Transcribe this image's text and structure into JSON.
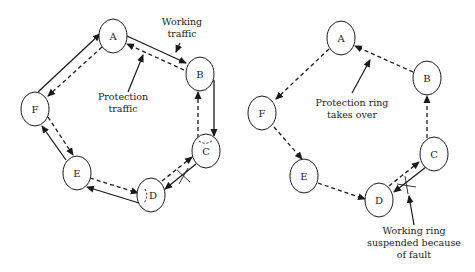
{
  "left_diagram": {
    "nodes": [
      {
        "id": "A",
        "label": "A",
        "cx": 113,
        "cy": 36
      },
      {
        "id": "B",
        "label": "B",
        "cx": 200,
        "cy": 74
      },
      {
        "id": "C",
        "label": "C",
        "cx": 206,
        "cy": 151
      },
      {
        "id": "D",
        "label": "D",
        "cx": 151,
        "cy": 195
      },
      {
        "id": "E",
        "label": "E",
        "cx": 77,
        "cy": 173
      },
      {
        "id": "F",
        "label": "F",
        "cx": 35,
        "cy": 109
      }
    ],
    "annotations": {
      "working_traffic": [
        "Working",
        "traffic"
      ],
      "protection_traffic": [
        "Protection",
        "traffic"
      ]
    }
  },
  "right_diagram": {
    "nodes": [
      {
        "id": "A",
        "label": "A",
        "cx": 341,
        "cy": 38
      },
      {
        "id": "B",
        "label": "B",
        "cx": 427,
        "cy": 78
      },
      {
        "id": "C",
        "label": "C",
        "cx": 434,
        "cy": 154
      },
      {
        "id": "D",
        "label": "D",
        "cx": 379,
        "cy": 200
      },
      {
        "id": "E",
        "label": "E",
        "cx": 304,
        "cy": 176
      },
      {
        "id": "F",
        "label": "F",
        "cx": 262,
        "cy": 113
      }
    ],
    "annotations": {
      "protection_ring": [
        "Protection ring",
        "takes over"
      ],
      "working_ring": [
        "Working ring",
        "suspended because",
        "of fault"
      ]
    }
  },
  "colors": {
    "line": "#1a1a1a",
    "text": "#222222",
    "background": "#ffffff"
  }
}
